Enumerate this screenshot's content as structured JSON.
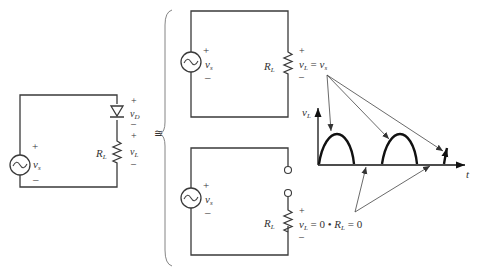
{
  "left_circuit": {
    "source_label": "v",
    "source_sub": "s",
    "plus": "+",
    "minus": "–",
    "diode_label": "v",
    "diode_sub": "D",
    "load_label": "R",
    "load_sub": "L",
    "load_voltage": "v",
    "load_voltage_sub": "L"
  },
  "equivalence_symbol": "≅",
  "top_circuit": {
    "source_label": "v",
    "source_sub": "s",
    "plus": "+",
    "minus": "–",
    "load_label": "R",
    "load_sub": "L",
    "equation": {
      "lhs": "v",
      "lhs_sub": "L",
      "eq": " = ",
      "rhs": "v",
      "rhs_sub": "s"
    }
  },
  "bottom_circuit": {
    "source_label": "v",
    "source_sub": "s",
    "plus": "+",
    "minus": "–",
    "load_label": "R",
    "load_sub": "L",
    "equation": {
      "lhs": "v",
      "lhs_sub": "L",
      "mid": " = 0 • ",
      "r": "R",
      "r_sub": "L",
      "end": " = 0"
    }
  },
  "waveform": {
    "y_axis_label": "v",
    "y_axis_sub": "L",
    "x_axis_label": "t"
  },
  "colors": {
    "wire": "#3a3a3a",
    "waveform": "#111111",
    "text": "#333333"
  }
}
